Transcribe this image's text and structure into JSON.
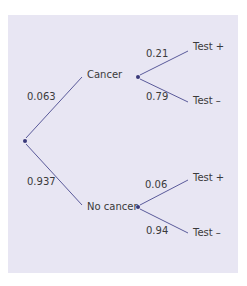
{
  "diagram": {
    "type": "probability-tree",
    "colors": {
      "background": "#e8e6f3",
      "line": "#5a5a9a",
      "node": "#3a3a7a",
      "text": "#3a3a3a"
    },
    "root": {
      "branches": [
        {
          "label": "Cancer",
          "probability": "0.063",
          "branches": [
            {
              "label": "Test +",
              "probability": "0.21"
            },
            {
              "label": "Test –",
              "probability": "0.79"
            }
          ]
        },
        {
          "label": "No cancer",
          "probability": "0.937",
          "branches": [
            {
              "label": "Test +",
              "probability": "0.06"
            },
            {
              "label": "Test –",
              "probability": "0.94"
            }
          ]
        }
      ]
    }
  }
}
